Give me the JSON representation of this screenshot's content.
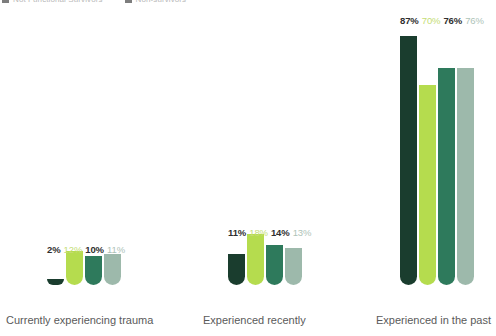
{
  "legend": {
    "items": [
      {
        "label": "Not Functional Survivors",
        "color": "#7d7d7d"
      },
      {
        "label": "Non-survivors",
        "color": "#7d7d7d"
      }
    ]
  },
  "chart_data": {
    "type": "bar",
    "title": "",
    "xlabel": "",
    "ylabel": "",
    "ylim": [
      0,
      100
    ],
    "grid": false,
    "legend_position": "top-left",
    "categories": [
      "Currently experiencing trauma",
      "Experienced recently",
      "Experienced in the past"
    ],
    "series": [
      {
        "name": "Series 1",
        "color": "#1a3d2e",
        "label_color": "#2f2f2f",
        "label_weight": "bold",
        "values": [
          2,
          11,
          87
        ],
        "value_labels": [
          "2%",
          "11%",
          "87%"
        ]
      },
      {
        "name": "Series 2",
        "color": "#b5dc4e",
        "label_color": "#c4dd76",
        "label_weight": "normal",
        "values": [
          12,
          18,
          70
        ],
        "value_labels": [
          "12%",
          "18%",
          "70%"
        ]
      },
      {
        "name": "Series 3",
        "color": "#2e7a5c",
        "label_color": "#2f2f2f",
        "label_weight": "bold",
        "values": [
          10,
          14,
          76
        ],
        "value_labels": [
          "10%",
          "14%",
          "76%"
        ]
      },
      {
        "name": "Series 4",
        "color": "#9db9ab",
        "label_color": "#aec3b8",
        "label_weight": "normal",
        "values": [
          11,
          13,
          76
        ],
        "value_labels": [
          "11%",
          "13%",
          "76%"
        ]
      }
    ]
  },
  "layout": {
    "groups": [
      {
        "x": 47,
        "label_x": 6,
        "labels_y": 244
      },
      {
        "x": 228,
        "label_x": 203,
        "labels_y": 227
      },
      {
        "x": 400,
        "label_x": 376,
        "labels_y": 15
      }
    ],
    "baseline_y": 285,
    "px_per_percent": 2.86
  }
}
